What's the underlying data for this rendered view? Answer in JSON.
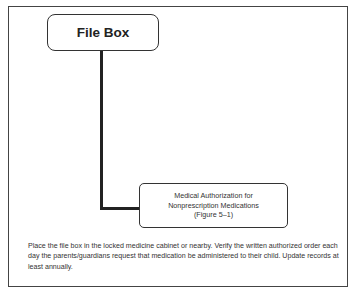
{
  "diagram": {
    "root": {
      "label": "File Box"
    },
    "child": {
      "lines": [
        "Medical Authorization for",
        "Nonprescription Medications",
        "(Figure 5–1)"
      ]
    },
    "note": "Place the file box in the locked medicine cabinet or nearby. Verify the written authorized order each day the parents/guardians request that medication be administered to their child. Update records at least annually."
  }
}
